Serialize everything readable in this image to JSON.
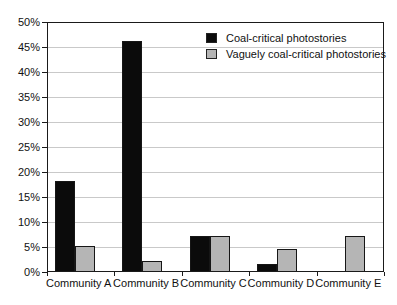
{
  "chart_data": {
    "type": "bar",
    "title": "",
    "xlabel": "",
    "ylabel": "",
    "categories": [
      "Community A",
      "Community B",
      "Community C",
      "Community D",
      "Community E"
    ],
    "series": [
      {
        "name": "Coal-critical photostories",
        "color": "#0b0b0b",
        "values": [
          18,
          46,
          7,
          1.5,
          0
        ]
      },
      {
        "name": "Vaguely coal-critical photostories",
        "color": "#b5b5b5",
        "values": [
          5,
          2,
          7,
          4.5,
          7
        ]
      }
    ],
    "ylim": [
      0,
      50
    ],
    "ytick_step": 5,
    "ytick_labels_top_to_bottom": [
      "50%",
      "45%",
      "40%",
      "35%",
      "30%",
      "25%",
      "20%",
      "15%",
      "10%",
      "5%",
      "0%"
    ],
    "grid": true,
    "legend_position": "top-right-inside"
  },
  "colors": {
    "background": "#ffffff",
    "plot_border": "#1a1a1a",
    "gridline": "#c9c9c9",
    "bar_border": "#161616",
    "text": "#111111"
  }
}
